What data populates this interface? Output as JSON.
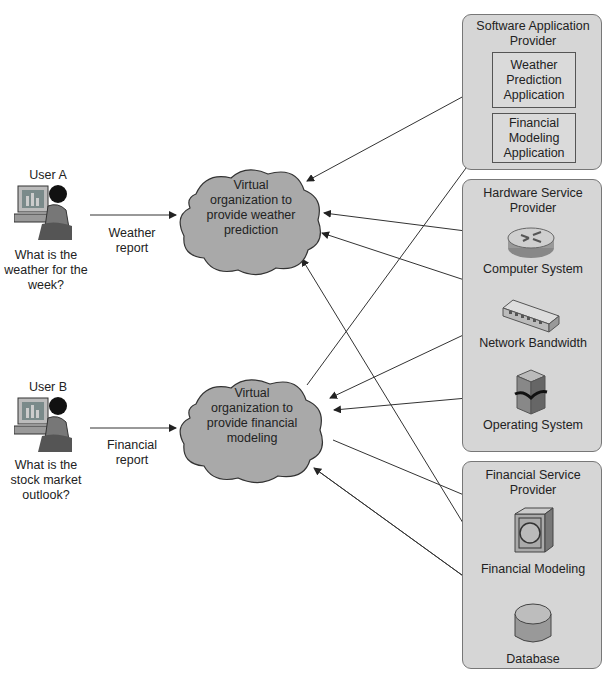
{
  "users": [
    {
      "label": "User A",
      "question": "What is the weather for the week?",
      "request": "Weather report"
    },
    {
      "label": "User B",
      "question": "What is the stock market outlook?",
      "request": "Financial report"
    }
  ],
  "virtual_orgs": [
    {
      "label": "Virtual organization to provide weather prediction"
    },
    {
      "label": "Virtual organization to provide financial modeling"
    }
  ],
  "providers": {
    "software": {
      "title": "Software Application Provider",
      "apps": [
        "Weather Prediction Application",
        "Financial Modeling Application"
      ]
    },
    "hardware": {
      "title": "Hardware Service Provider",
      "items": [
        "Computer System",
        "Network Bandwidth",
        "Operating System"
      ]
    },
    "financial": {
      "title": "Financial Service Provider",
      "items": [
        "Financial Modeling",
        "Database"
      ]
    }
  },
  "colors": {
    "cloud": "#a9a9a9",
    "provider_bg": "#d6d6d6",
    "line": "#333333"
  }
}
